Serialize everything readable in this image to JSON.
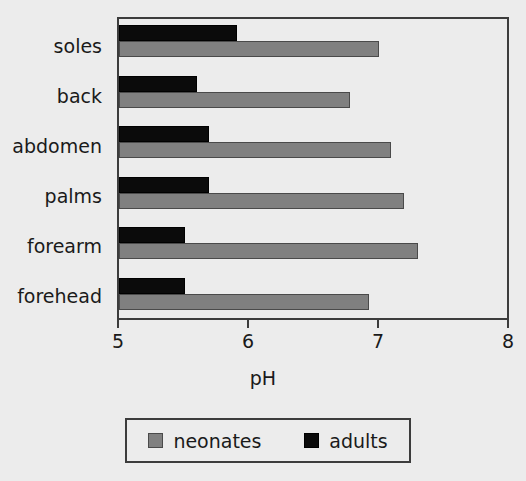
{
  "chart_data": {
    "type": "bar",
    "orientation": "horizontal",
    "title": "",
    "xlabel": "pH",
    "ylabel": "",
    "xlim": [
      5,
      8
    ],
    "xticks": [
      "5",
      "6",
      "7",
      "8"
    ],
    "grid": false,
    "legend_position": "bottom",
    "categories": [
      "forehead",
      "forearm",
      "palms",
      "abdomen",
      "back",
      "soles"
    ],
    "series": [
      {
        "name": "neonates",
        "color": "#808080",
        "values": [
          6.92,
          7.3,
          7.19,
          7.09,
          6.78,
          7.0
        ]
      },
      {
        "name": "adults",
        "color": "#0b0b0b",
        "values": [
          5.51,
          5.51,
          5.69,
          5.69,
          5.6,
          5.91
        ]
      }
    ]
  },
  "axis": {
    "x_title": "pH",
    "tick_labels": [
      "5",
      "6",
      "7",
      "8"
    ]
  },
  "categories": [
    {
      "label": "soles"
    },
    {
      "label": "back"
    },
    {
      "label": "abdomen"
    },
    {
      "label": "palms"
    },
    {
      "label": "forearm"
    },
    {
      "label": "forehead"
    }
  ],
  "legend": {
    "entries": [
      {
        "label": "neonates",
        "swatch": "gray-square-swatch"
      },
      {
        "label": "adults",
        "swatch": "black-square-swatch"
      }
    ]
  },
  "colors": {
    "neonates": "#808080",
    "adults": "#0b0b0b",
    "axis": "#3c3c3c",
    "background": "#ececec",
    "text": "#1a1a1a"
  }
}
